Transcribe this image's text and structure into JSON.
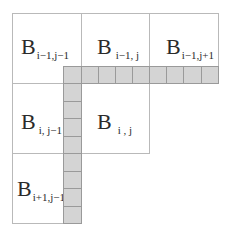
{
  "diagram": {
    "colors": {
      "cell_border": "#b9b9b9",
      "strip_fill": "#d4d4d4",
      "strip_border": "#9a9a9a",
      "text": "#2a2a2a"
    },
    "blocks": [
      {
        "id": "b00",
        "base": "B",
        "sub": "i−1,j−1"
      },
      {
        "id": "b01",
        "base": "B",
        "sub": "i−1, j"
      },
      {
        "id": "b02",
        "base": "B",
        "sub": "i−1,j+1"
      },
      {
        "id": "b10",
        "base": "B",
        "sub": "i, j−1"
      },
      {
        "id": "b11",
        "base": "B",
        "sub": "i , j"
      },
      {
        "id": "b20",
        "base": "B",
        "sub": "i+1,j−1"
      }
    ],
    "horizontal_strip_cells": 9,
    "vertical_strip_cells": 9
  }
}
